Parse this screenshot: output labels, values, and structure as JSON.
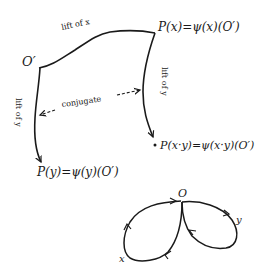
{
  "upper_figure": {
    "origin_label": "O′",
    "point_x_label": "P(x)=ψ(x)(O′)",
    "point_y_label": "P(y)=ψ(y)(O′)",
    "point_xy_label": "P(x·y)=ψ(x·y)(O′)",
    "top_curve_label": "lift of x",
    "left_curve_label": "lift of y",
    "right_curve_label": "lift of y",
    "center_label": "conjugate"
  },
  "lower_figure": {
    "origin_label": "O",
    "loop_x_label": "x",
    "loop_y_label": "y"
  },
  "colors": {
    "ink": "#1a1a1a",
    "background": "#ffffff"
  }
}
